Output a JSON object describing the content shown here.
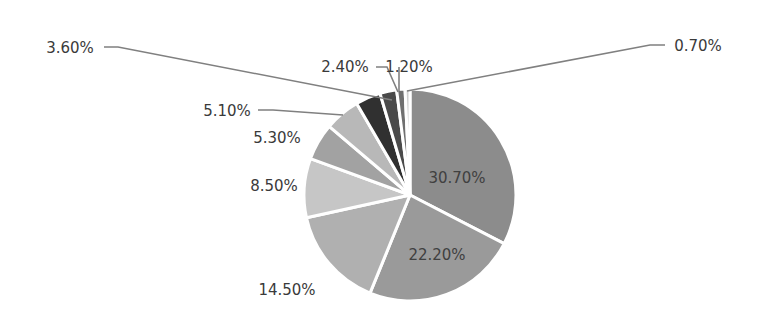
{
  "chart_data": {
    "type": "pie",
    "title": "",
    "start_angle_deg": 0,
    "direction": "clockwise",
    "slices": [
      {
        "label": "30.70%",
        "value": 30.7,
        "color": "#8c8c8c",
        "label_pos": "inside"
      },
      {
        "label": "22.20%",
        "value": 22.2,
        "color": "#9a9a9a",
        "label_pos": "inside"
      },
      {
        "label": "14.50%",
        "value": 14.5,
        "color": "#b0b0b0",
        "label_pos": "outside"
      },
      {
        "label": "8.50%",
        "value": 8.5,
        "color": "#c6c6c6",
        "label_pos": "outside"
      },
      {
        "label": "5.30%",
        "value": 5.3,
        "color": "#a2a2a2",
        "label_pos": "outside"
      },
      {
        "label": "5.10%",
        "value": 5.1,
        "color": "#b8b8b8",
        "label_pos": "outside"
      },
      {
        "label": "3.60%",
        "value": 3.6,
        "color": "#303030",
        "label_pos": "outside-leader"
      },
      {
        "label": "2.40%",
        "value": 2.4,
        "color": "#4a4a4a",
        "label_pos": "outside-leader"
      },
      {
        "label": "1.20%",
        "value": 1.2,
        "color": "#707070",
        "label_pos": "outside-leader"
      },
      {
        "label": "0.70%",
        "value": 0.7,
        "color": "#d0d0d0",
        "label_pos": "outside-leader"
      }
    ],
    "legend": null,
    "slice_border_color": "#ffffff"
  }
}
